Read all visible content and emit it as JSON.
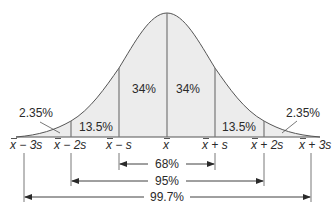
{
  "diagram": {
    "colors": {
      "fill": "#ececec",
      "stroke": "#555555",
      "text": "#2a2a2a",
      "background": "#ffffff"
    },
    "regions": [
      {
        "id": "left-tail",
        "label": "2.35%"
      },
      {
        "id": "left-2s",
        "label": "13.5%"
      },
      {
        "id": "left-1s",
        "label": "34%"
      },
      {
        "id": "right-1s",
        "label": "34%"
      },
      {
        "id": "right-2s",
        "label": "13.5%"
      },
      {
        "id": "right-tail",
        "label": "2.35%"
      }
    ],
    "axis_labels": [
      {
        "base": "x",
        "suffix": " − 3s"
      },
      {
        "base": "x",
        "suffix": " − 2s"
      },
      {
        "base": "x",
        "suffix": " − s"
      },
      {
        "base": "x",
        "suffix": ""
      },
      {
        "base": "x",
        "suffix": " + s"
      },
      {
        "base": "x",
        "suffix": " + 2s"
      },
      {
        "base": "x",
        "suffix": " + 3s"
      }
    ],
    "ranges": [
      {
        "label": "68%",
        "from": "x̄ − s",
        "to": "x̄ + s"
      },
      {
        "label": "95%",
        "from": "x̄ − 2s",
        "to": "x̄ + 2s"
      },
      {
        "label": "99.7%",
        "from": "x̄ − 3s",
        "to": "x̄ + 3s"
      }
    ]
  }
}
